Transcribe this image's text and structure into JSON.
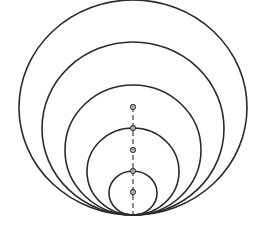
{
  "diagram": {
    "stroke_color": "#2b2b2b",
    "background": "#ffffff",
    "tangent_point": {
      "x": 133,
      "y": 215
    },
    "axis": {
      "x": 133,
      "y_top": 107,
      "y_bottom": 215,
      "style": "dashed"
    },
    "circles": [
      {
        "id": "c1",
        "cx": 133,
        "cy": 107.5,
        "rx": 114,
        "ry": 107.5
      },
      {
        "id": "c2",
        "cx": 133,
        "cy": 128.5,
        "rx": 91,
        "ry": 86.5
      },
      {
        "id": "c3",
        "cx": 133,
        "cy": 150,
        "rx": 68,
        "ry": 65
      },
      {
        "id": "c4",
        "cx": 133,
        "cy": 171.5,
        "rx": 46,
        "ry": 43.5
      },
      {
        "id": "c5",
        "cx": 133,
        "cy": 193,
        "rx": 24,
        "ry": 22
      }
    ],
    "center_marks": [
      {
        "id": "m1",
        "x": 133,
        "y": 107
      },
      {
        "id": "m2",
        "x": 133,
        "y": 128
      },
      {
        "id": "m3",
        "x": 133,
        "y": 150
      },
      {
        "id": "m4",
        "x": 133,
        "y": 171
      },
      {
        "id": "m5",
        "x": 133,
        "y": 192
      }
    ]
  }
}
